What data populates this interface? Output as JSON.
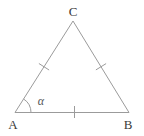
{
  "figure": {
    "type": "geometry-triangle",
    "vertices": [
      {
        "id": "A",
        "label": "A",
        "position": "bottom-left"
      },
      {
        "id": "B",
        "label": "B",
        "position": "bottom-right"
      },
      {
        "id": "C",
        "label": "C",
        "position": "top"
      }
    ],
    "sides": [
      {
        "name": "AB",
        "tick_marks": 1
      },
      {
        "name": "AC",
        "tick_marks": 1
      },
      {
        "name": "CB",
        "tick_marks": 1
      }
    ],
    "angle": {
      "label": "α",
      "vertex": "A"
    },
    "colors": {
      "line": "#9b9b9b",
      "label": "#3a3a3a",
      "angle_label": "#555555",
      "background": "#ffffff"
    }
  }
}
